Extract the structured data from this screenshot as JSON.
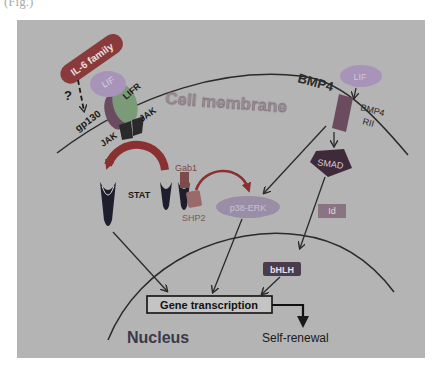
{
  "figure": {
    "caption_fragment": "(Fig.)",
    "panel_color": "#b4b4b4",
    "labels": {
      "il6_family": "IL-6 family",
      "lif_left": "LIF",
      "lifr": "LIFR",
      "gp130": "gp130",
      "question": "?",
      "jak_left": "JAK",
      "jak_right": "JAK",
      "cell_membrane": "Cell membrane",
      "bmp4": "BMP4",
      "lif_right": "LIF",
      "bmp4_rii_1": "BMP4",
      "bmp4_rii_2": "RII",
      "smad": "SMAD",
      "stat": "STAT",
      "gab1": "Gab1",
      "shp2": "SHP2",
      "p38_erk": "p38-ERK",
      "id": "Id",
      "bhlh": "bHLH",
      "gene_transcription": "Gene transcription",
      "self_renewal": "Self-renewal",
      "nucleus": "Nucleus"
    },
    "colors": {
      "il6_family": "#8a3a3a",
      "lif": "#a894b8",
      "lifr": "#7a9a78",
      "gp130": "#6a4c60",
      "jak": "#2a2a2a",
      "stat": "#1e1e2c",
      "gab1": "#7c4c4c",
      "shp2": "#9a6a6a",
      "p38_erk": "#9a8ea6",
      "smad": "#3e2a3a",
      "receptor": "#6a4c5e",
      "id": "#8a7484",
      "bhlh": "#4a3c4a",
      "arrow_red": "#8a3030",
      "line": "#2a2a2a"
    }
  }
}
